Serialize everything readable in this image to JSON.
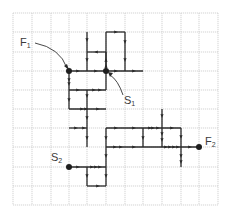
{
  "diagram": {
    "type": "grid-path-diagram",
    "grid": {
      "columns": 11,
      "rows": 10,
      "x_lines": [
        13,
        32,
        51,
        69,
        87,
        106,
        125,
        143,
        162,
        181,
        199,
        218
      ],
      "y_lines": [
        13,
        32,
        52,
        71,
        90,
        109,
        128,
        147,
        167,
        186,
        205
      ],
      "color": "#c8c8c8"
    },
    "path_color": "#2a2a2a",
    "nodes": [
      {
        "id": "F1",
        "letter": "F",
        "sub": "1",
        "x": 69,
        "y": 71,
        "label_x": 20,
        "label_y": 37
      },
      {
        "id": "S1",
        "letter": "S",
        "sub": "1",
        "x": 106,
        "y": 71,
        "label_x": 124,
        "label_y": 95
      },
      {
        "id": "S2",
        "letter": "S",
        "sub": "2",
        "x": 69,
        "y": 167,
        "label_x": 51,
        "label_y": 152
      },
      {
        "id": "F2",
        "letter": "F",
        "sub": "2",
        "x": 199,
        "y": 147,
        "label_x": 205,
        "label_y": 136
      }
    ],
    "segments": [
      [
        87,
        32,
        87,
        71
      ],
      [
        87,
        52,
        106,
        52
      ],
      [
        106,
        52,
        106,
        71
      ],
      [
        106,
        71,
        106,
        32
      ],
      [
        106,
        32,
        125,
        32
      ],
      [
        125,
        32,
        125,
        71
      ],
      [
        69,
        71,
        143,
        71
      ],
      [
        69,
        71,
        69,
        109
      ],
      [
        69,
        90,
        106,
        90
      ],
      [
        106,
        71,
        106,
        90
      ],
      [
        87,
        90,
        87,
        147
      ],
      [
        69,
        109,
        106,
        109
      ],
      [
        69,
        128,
        87,
        128
      ],
      [
        106,
        128,
        181,
        128
      ],
      [
        106,
        128,
        106,
        186
      ],
      [
        143,
        128,
        143,
        147
      ],
      [
        162,
        109,
        162,
        147
      ],
      [
        181,
        128,
        181,
        167
      ],
      [
        106,
        147,
        199,
        147
      ],
      [
        69,
        167,
        106,
        167
      ],
      [
        87,
        167,
        87,
        186
      ],
      [
        87,
        186,
        106,
        186
      ]
    ],
    "arrows": [
      {
        "x": 87,
        "y": 40,
        "dir": "down"
      },
      {
        "x": 87,
        "y": 60,
        "dir": "down"
      },
      {
        "x": 96,
        "y": 52,
        "dir": "left"
      },
      {
        "x": 106,
        "y": 60,
        "dir": "up"
      },
      {
        "x": 106,
        "y": 66,
        "dir": "up"
      },
      {
        "x": 116,
        "y": 32,
        "dir": "right"
      },
      {
        "x": 125,
        "y": 42,
        "dir": "down"
      },
      {
        "x": 125,
        "y": 60,
        "dir": "down"
      },
      {
        "x": 78,
        "y": 71,
        "dir": "right"
      },
      {
        "x": 96,
        "y": 71,
        "dir": "right"
      },
      {
        "x": 116,
        "y": 71,
        "dir": "right"
      },
      {
        "x": 134,
        "y": 71,
        "dir": "right"
      },
      {
        "x": 69,
        "y": 80,
        "dir": "down"
      },
      {
        "x": 69,
        "y": 84,
        "dir": "down"
      },
      {
        "x": 69,
        "y": 100,
        "dir": "down"
      },
      {
        "x": 78,
        "y": 90,
        "dir": "right"
      },
      {
        "x": 94,
        "y": 90,
        "dir": "right"
      },
      {
        "x": 100,
        "y": 90,
        "dir": "right"
      },
      {
        "x": 87,
        "y": 96,
        "dir": "down"
      },
      {
        "x": 87,
        "y": 118,
        "dir": "down"
      },
      {
        "x": 87,
        "y": 138,
        "dir": "down"
      },
      {
        "x": 82,
        "y": 109,
        "dir": "right"
      },
      {
        "x": 86,
        "y": 109,
        "dir": "right"
      },
      {
        "x": 98,
        "y": 109,
        "dir": "right"
      },
      {
        "x": 76,
        "y": 128,
        "dir": "right"
      },
      {
        "x": 84,
        "y": 128,
        "dir": "right"
      },
      {
        "x": 116,
        "y": 128,
        "dir": "right"
      },
      {
        "x": 134,
        "y": 128,
        "dir": "right"
      },
      {
        "x": 150,
        "y": 128,
        "dir": "right"
      },
      {
        "x": 153,
        "y": 128,
        "dir": "right"
      },
      {
        "x": 158,
        "y": 128,
        "dir": "right"
      },
      {
        "x": 172,
        "y": 128,
        "dir": "right"
      },
      {
        "x": 143,
        "y": 138,
        "dir": "down"
      },
      {
        "x": 162,
        "y": 116,
        "dir": "down"
      },
      {
        "x": 162,
        "y": 134,
        "dir": "down"
      },
      {
        "x": 162,
        "y": 140,
        "dir": "down"
      },
      {
        "x": 181,
        "y": 137,
        "dir": "down"
      },
      {
        "x": 181,
        "y": 156,
        "dir": "down"
      },
      {
        "x": 181,
        "y": 162,
        "dir": "down"
      },
      {
        "x": 115,
        "y": 147,
        "dir": "right"
      },
      {
        "x": 121,
        "y": 147,
        "dir": "right"
      },
      {
        "x": 134,
        "y": 147,
        "dir": "right"
      },
      {
        "x": 166,
        "y": 147,
        "dir": "right"
      },
      {
        "x": 170,
        "y": 147,
        "dir": "right"
      },
      {
        "x": 174,
        "y": 147,
        "dir": "right"
      },
      {
        "x": 178,
        "y": 147,
        "dir": "right"
      },
      {
        "x": 190,
        "y": 147,
        "dir": "right"
      },
      {
        "x": 106,
        "y": 138,
        "dir": "down"
      },
      {
        "x": 106,
        "y": 156,
        "dir": "down"
      },
      {
        "x": 106,
        "y": 176,
        "dir": "down"
      },
      {
        "x": 78,
        "y": 167,
        "dir": "right"
      },
      {
        "x": 92,
        "y": 167,
        "dir": "right"
      },
      {
        "x": 96,
        "y": 167,
        "dir": "right"
      },
      {
        "x": 100,
        "y": 167,
        "dir": "right"
      },
      {
        "x": 87,
        "y": 176,
        "dir": "down"
      },
      {
        "x": 98,
        "y": 186,
        "dir": "right"
      }
    ],
    "pointers": [
      {
        "id": "F1",
        "d": "M 35 43 Q 60 48 67 68"
      },
      {
        "id": "S1",
        "d": "M 123 95 Q 118 80 110 75"
      }
    ]
  }
}
